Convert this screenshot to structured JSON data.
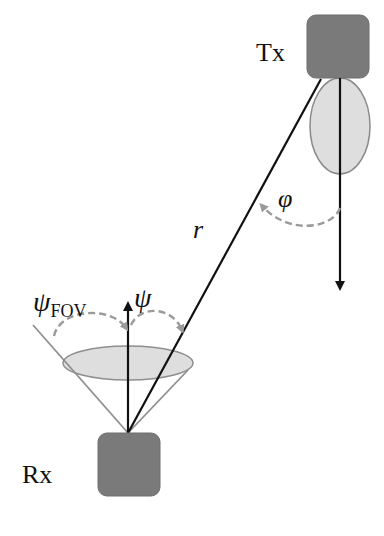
{
  "diagram": {
    "type": "optical wireless link geometry",
    "nodes": {
      "transmitter": {
        "label": "Tx"
      },
      "receiver": {
        "label": "Rx"
      }
    },
    "link": {
      "distance_label": "r"
    },
    "angles": {
      "irradiance": {
        "label": "φ"
      },
      "incidence": {
        "label": "ψ"
      },
      "field_of_view": {
        "symbol": "ψ",
        "subscript": "FOV"
      }
    },
    "colors": {
      "device_fill": "#7a7a7a",
      "pattern_fill": "#dedede",
      "pattern_stroke": "#8a8a8a",
      "cone_stroke": "#8f8f8f",
      "line": "#111111",
      "dashed_arc": "#9a9a9a"
    }
  }
}
